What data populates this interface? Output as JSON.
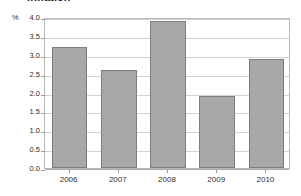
{
  "chart_data": {
    "type": "bar",
    "title": "Inflation",
    "xlabel": "",
    "ylabel": "",
    "unit_label": "%",
    "categories": [
      "2006",
      "2007",
      "2008",
      "2009",
      "2010"
    ],
    "values": [
      3.2,
      2.6,
      3.9,
      1.9,
      2.9
    ],
    "series": [
      {
        "name": "Inflation",
        "values": [
          3.2,
          2.6,
          3.9,
          1.9,
          2.9
        ]
      }
    ],
    "ylim": [
      0.0,
      4.0
    ],
    "ytick_labels": [
      "4.0",
      "3.5",
      "3.0",
      "2.5",
      "2.0",
      "1.5",
      "1.0",
      "0.5",
      "0.0"
    ],
    "ytick_values": [
      4.0,
      3.5,
      3.0,
      2.5,
      2.0,
      1.5,
      1.0,
      0.5,
      0.0
    ],
    "grid": true,
    "legend": false,
    "legend_position": "none",
    "bar_color": "#a8a8a8",
    "bar_border_color": "#7d7d7d",
    "gridline_color": "#d2d2d2",
    "frame_color": "#b9b9b9",
    "background_color": "#ffffff"
  }
}
